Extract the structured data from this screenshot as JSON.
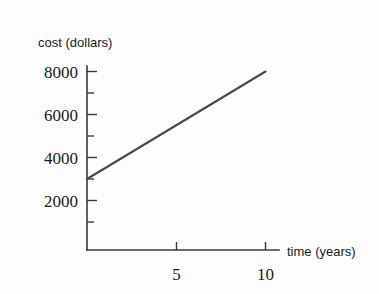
{
  "chart_data": {
    "type": "line",
    "title": "",
    "xlabel": "time (years)",
    "ylabel": "cost (dollars)",
    "xlim": [
      0,
      10.7
    ],
    "ylim": [
      0,
      8600
    ],
    "grid": false,
    "legend": null,
    "x": [
      0,
      10
    ],
    "values": [
      3000,
      8000
    ],
    "series": [
      {
        "name": "cost",
        "x": [
          0,
          10
        ],
        "values": [
          3000,
          8000
        ],
        "color": "#4a4a4a"
      }
    ],
    "x_tick_labels": [
      "5",
      "10"
    ],
    "x_tick_values": [
      5,
      10
    ],
    "y_tick_labels": [
      "2000",
      "4000",
      "6000",
      "8000"
    ],
    "y_tick_values": [
      2000,
      4000,
      6000,
      8000
    ],
    "y_minor_tick_values": [
      1000,
      3000,
      5000,
      7000
    ],
    "annotations": {
      "intercept": 3000,
      "slope_per_year": 500,
      "endpoint_value": 8000
    }
  },
  "labels": {
    "y_axis_title": "cost (dollars)",
    "x_axis_title": "time (years)",
    "y_tick_8000": "8000",
    "y_tick_6000": "6000",
    "y_tick_4000": "4000",
    "y_tick_2000": "2000",
    "x_tick_5": "5",
    "x_tick_10": "10"
  },
  "colors": {
    "background": "#fdfdfd",
    "axis": "#3a3a3a",
    "data_line": "#4a4a4a",
    "text": "#1a1a1a"
  }
}
